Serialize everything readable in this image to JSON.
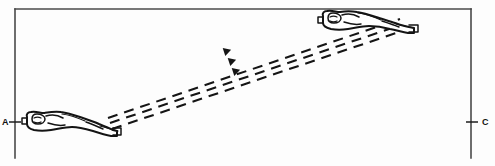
{
  "figure": {
    "type": "technical-line-diagram",
    "title": "",
    "background_color": "#fdfdfd",
    "ink_color": "#141414",
    "frame_color": "#4a4a4a",
    "labels": {
      "left": "A",
      "right": "C"
    },
    "soldiers": [
      {
        "id": "soldier-a",
        "position": "lower-left",
        "pose": "prone-firing",
        "label": "A"
      },
      {
        "id": "soldier-c",
        "position": "upper-right",
        "pose": "prone-firing",
        "label": "C"
      }
    ],
    "trajectories": {
      "count": 3,
      "style": "dashed",
      "direction": "left-to-right-ascending",
      "arrowheads": 3
    }
  }
}
